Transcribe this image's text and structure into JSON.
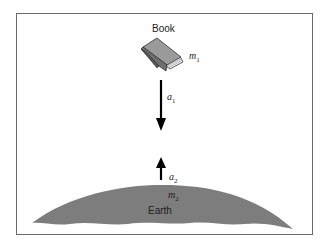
{
  "diagram": {
    "objects": {
      "book": {
        "label": "Book",
        "mass_symbol": "m",
        "mass_subscript": "1"
      },
      "earth": {
        "label": "Earth",
        "mass_symbol": "m",
        "mass_subscript": "2"
      }
    },
    "vectors": {
      "a1": {
        "symbol": "a",
        "subscript": "1",
        "direction": "down"
      },
      "a2": {
        "symbol": "a",
        "subscript": "2",
        "direction": "up"
      }
    },
    "colors": {
      "earth_fill": "#7d7d7d",
      "book_cover": "#9a9a9a",
      "arrow": "#000000",
      "frame": "#6a6a6a"
    }
  }
}
